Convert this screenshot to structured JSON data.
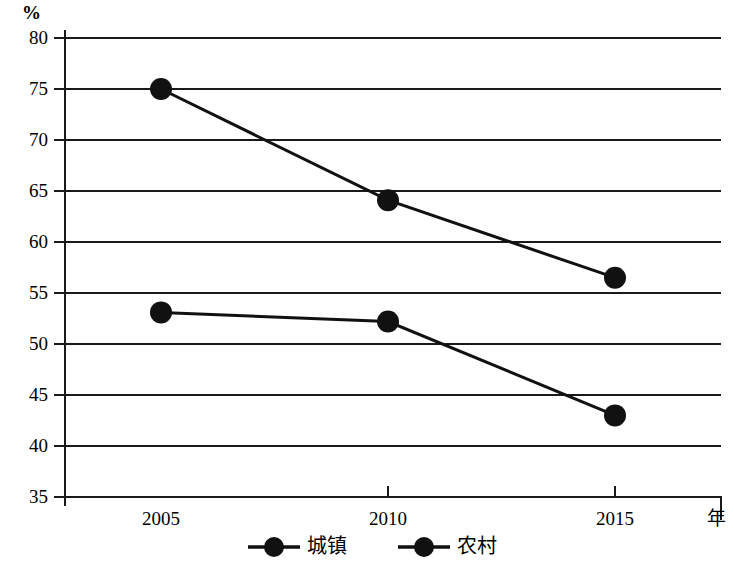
{
  "chart_data": {
    "type": "line",
    "title": "",
    "xlabel": "年",
    "ylabel": "%",
    "categories": [
      "2005",
      "2010",
      "2015"
    ],
    "x": [
      2005,
      2010,
      2015
    ],
    "series": [
      {
        "name": "城镇",
        "values": [
          53.1,
          52.2,
          43.0
        ]
      },
      {
        "name": "农村",
        "values": [
          75.0,
          64.1,
          56.5
        ]
      }
    ],
    "ylim": [
      35,
      80
    ],
    "yticks": [
      80,
      75,
      70,
      65,
      60,
      55,
      50,
      45,
      40,
      35
    ],
    "ytick_labels": [
      "80",
      "75",
      "70",
      "65",
      "60",
      "55",
      "50",
      "45",
      "40",
      "35"
    ],
    "grid": true,
    "legend_position": "bottom",
    "legend": [
      "城镇",
      "农村"
    ],
    "marker": "filled-circle",
    "line_color": "#1a1a1a",
    "marker_color": "#111111",
    "grid_color": "#1a1a1a",
    "background": "#ffffff"
  },
  "axes": {
    "y_unit": "%",
    "x_title": "年",
    "y_tick_labels": [
      "80",
      "75",
      "70",
      "65",
      "60",
      "55",
      "50",
      "45",
      "40",
      "35"
    ],
    "x_tick_labels": [
      "2005",
      "2010",
      "2015"
    ]
  },
  "legend": {
    "items": [
      {
        "label": "城镇",
        "marker": "filled-circle"
      },
      {
        "label": "农村",
        "marker": "filled-circle"
      }
    ]
  }
}
